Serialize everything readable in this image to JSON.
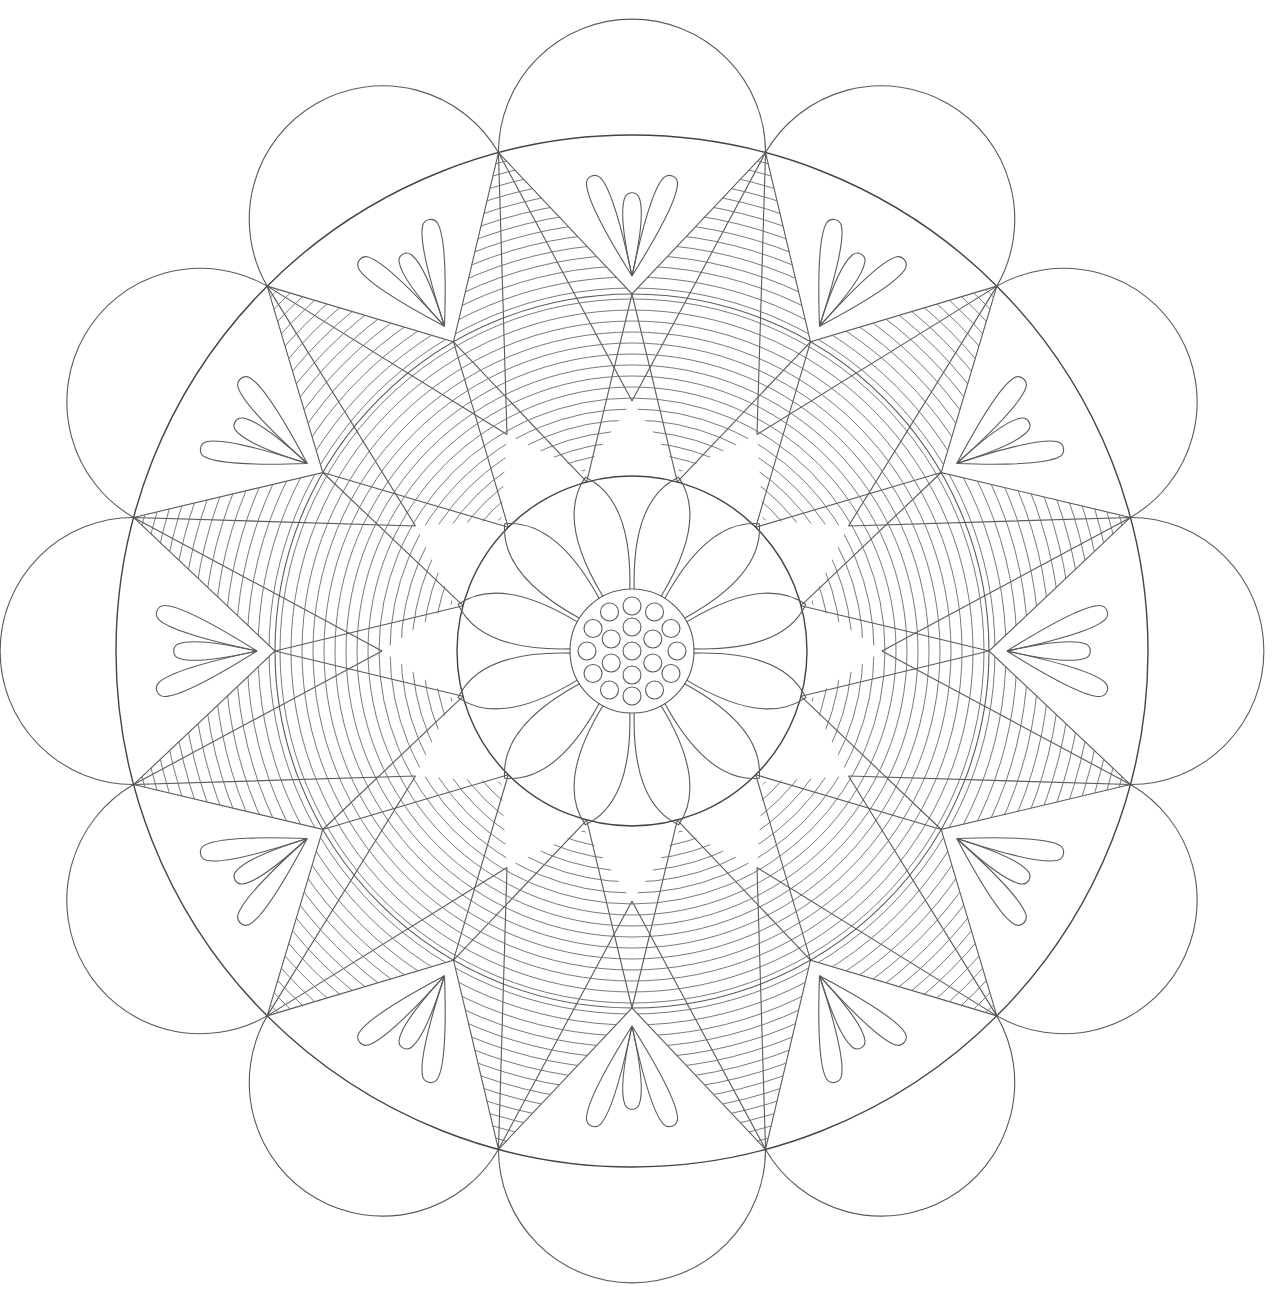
{
  "artwork": {
    "type": "mandala coloring page",
    "background": "#ffffff",
    "line_color": "#5a5a5a",
    "center": [
      632,
      651
    ],
    "symmetry": 12,
    "outer_scallops": 12,
    "center_dots": 19,
    "center_petals": 12
  }
}
